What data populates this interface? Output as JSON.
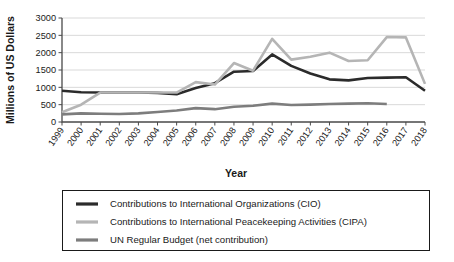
{
  "chart_data": {
    "type": "line",
    "title": "",
    "xlabel": "Year",
    "ylabel": "Millions of US Dollars",
    "xlim": [
      1999,
      2018
    ],
    "ylim": [
      0,
      3000
    ],
    "grid": true,
    "legend_position": "bottom",
    "x": [
      1999,
      2000,
      2001,
      2002,
      2003,
      2004,
      2005,
      2006,
      2007,
      2008,
      2009,
      2010,
      2011,
      2012,
      2013,
      2014,
      2015,
      2016,
      2017,
      2018
    ],
    "xtick_labels": [
      "1999",
      "2000",
      "2001",
      "2002",
      "2003",
      "2004",
      "2005",
      "2006",
      "2007",
      "2008",
      "2009",
      "2010",
      "2011",
      "2012",
      "2013",
      "2014",
      "2015",
      "2016",
      "2017",
      "2018"
    ],
    "ytick_labels": [
      "0",
      "500",
      "1000",
      "1500",
      "2000",
      "2500",
      "3000"
    ],
    "ytick_values": [
      0,
      500,
      1000,
      1500,
      2000,
      2500,
      3000
    ],
    "series": [
      {
        "name": "Contributions to International Organizations (CIO)",
        "short_name": "CIO",
        "color": "#2b2b2b",
        "width": 2.6,
        "values": [
          900,
          860,
          850,
          850,
          850,
          840,
          800,
          980,
          1120,
          1450,
          1470,
          1950,
          1620,
          1400,
          1230,
          1200,
          1270,
          1280,
          1290,
          900
        ]
      },
      {
        "name": "Contributions to International Peacekeeping Activities (CIPA)",
        "short_name": "CIPA",
        "color": "#b5b5b5",
        "width": 2.6,
        "values": [
          280,
          500,
          850,
          850,
          850,
          850,
          850,
          1150,
          1080,
          1700,
          1480,
          2400,
          1800,
          1880,
          2000,
          1760,
          1780,
          2450,
          2440,
          1100
        ]
      },
      {
        "name": "UN Regular Budget (net contribution)",
        "short_name": "UN Regular Budget",
        "color": "#7d7d7d",
        "width": 2.6,
        "values": [
          220,
          250,
          240,
          230,
          250,
          290,
          330,
          400,
          370,
          440,
          470,
          530,
          490,
          500,
          520,
          530,
          540,
          520,
          null,
          null
        ]
      }
    ]
  }
}
